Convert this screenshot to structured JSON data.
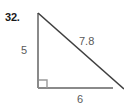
{
  "figure": {
    "problem_number": "32.",
    "shape": "right-triangle",
    "background_color": "#ffffff",
    "labels": {
      "leg_vertical": "5",
      "leg_horizontal": "6",
      "hypotenuse": "7.8"
    },
    "colors": {
      "leg_stroke": "#8a8a8a",
      "hypotenuse_stroke": "#3f3f3f",
      "right_angle_stroke": "#8a8a8a",
      "label_text": "#5a5a5a",
      "number_text": "#1a1a1a"
    },
    "geometry": {
      "apex": [
        38,
        13
      ],
      "right_angle_vertex": [
        38,
        88
      ],
      "far_vertex": [
        124,
        88
      ],
      "right_angle_marker": [
        39,
        80,
        8,
        8
      ]
    }
  }
}
